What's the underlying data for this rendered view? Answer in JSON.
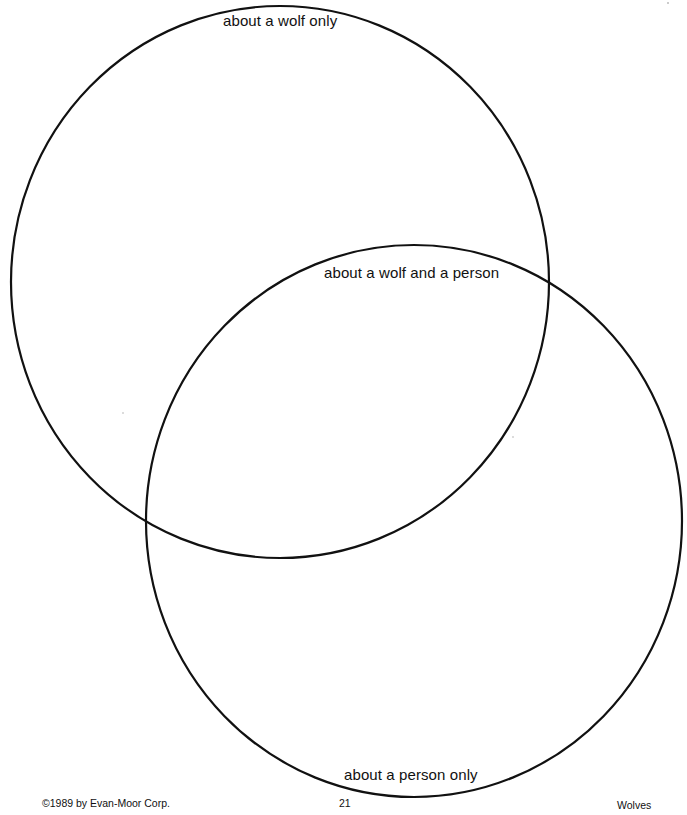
{
  "venn": {
    "circles": [
      {
        "id": "wolf",
        "label": "about a wolf only",
        "cx": 280,
        "cy": 282,
        "rx": 269,
        "ry": 276
      },
      {
        "id": "person",
        "label": "about a person only",
        "cx": 414,
        "cy": 521,
        "rx": 268,
        "ry": 276
      }
    ],
    "labels": {
      "wolf_only": "about a wolf only",
      "both": "about a wolf and a person",
      "person_only": "about a person only"
    },
    "stroke_color": "#111111"
  },
  "footer": {
    "copyright": "©1989 by Evan-Moor Corp.",
    "page_number": "21",
    "book_title": "Wolves"
  }
}
